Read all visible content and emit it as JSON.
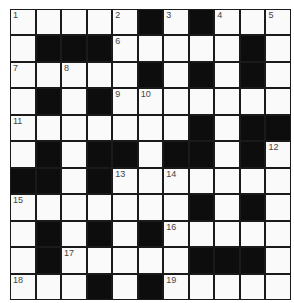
{
  "puzzle": {
    "rows": 11,
    "cols": 11,
    "colors": {
      "black": "#0d0d0d",
      "white": "#fafafa",
      "line": "#1a1a1a",
      "number": "#444444"
    },
    "grid": [
      "WWWWWBWBWWW",
      "WBBBWWWWWBW",
      "WWWWWBWBWBW",
      "WBWBWWWWWWW",
      "WWWWWWWBWBB",
      "WBWBBWBBWBW",
      "BBWBWWWWWWW",
      "WWWWWWWBWBW",
      "WBWBWBWWWWW",
      "WBWWWWWBBBW",
      "WWWBWBWWWWW"
    ],
    "numbers": [
      {
        "r": 0,
        "c": 0,
        "n": "1"
      },
      {
        "r": 0,
        "c": 4,
        "n": "2"
      },
      {
        "r": 0,
        "c": 6,
        "n": "3"
      },
      {
        "r": 0,
        "c": 8,
        "n": "4"
      },
      {
        "r": 0,
        "c": 10,
        "n": "5"
      },
      {
        "r": 1,
        "c": 4,
        "n": "6"
      },
      {
        "r": 2,
        "c": 0,
        "n": "7"
      },
      {
        "r": 2,
        "c": 2,
        "n": "8"
      },
      {
        "r": 3,
        "c": 4,
        "n": "9"
      },
      {
        "r": 3,
        "c": 5,
        "n": "10"
      },
      {
        "r": 4,
        "c": 0,
        "n": "11"
      },
      {
        "r": 5,
        "c": 10,
        "n": "12"
      },
      {
        "r": 6,
        "c": 4,
        "n": "13"
      },
      {
        "r": 6,
        "c": 6,
        "n": "14"
      },
      {
        "r": 7,
        "c": 0,
        "n": "15"
      },
      {
        "r": 8,
        "c": 6,
        "n": "16"
      },
      {
        "r": 9,
        "c": 2,
        "n": "17"
      },
      {
        "r": 10,
        "c": 0,
        "n": "18"
      },
      {
        "r": 10,
        "c": 6,
        "n": "19"
      }
    ]
  }
}
